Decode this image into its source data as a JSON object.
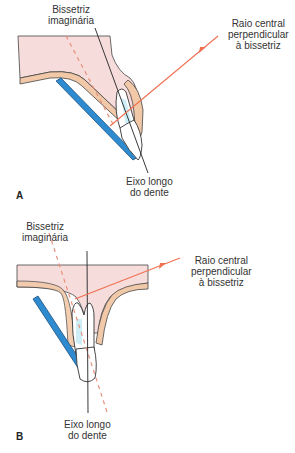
{
  "colors": {
    "gum": "#f7dcdc",
    "gum_edge": "#b07070",
    "mucosa": "#f2c9a8",
    "film": "#2e8bd0",
    "film_edge": "#1a4f80",
    "pulp": "#cdeef6",
    "central_ray": "#f07050",
    "bisector": "#e8907a",
    "axis": "#222222"
  },
  "panels": [
    {
      "letter": "A",
      "labels": {
        "bisector_line1": "Bissetriz",
        "bisector_line2": "imaginária",
        "ray_line1": "Raio central",
        "ray_line2": "perpendicular",
        "ray_line3": "à bissetriz",
        "axis_line1": "Eixo longo",
        "axis_line2": "do dente"
      }
    },
    {
      "letter": "B",
      "labels": {
        "bisector_line1": "Bissetriz",
        "bisector_line2": "imaginária",
        "ray_line1": "Raio central",
        "ray_line2": "perpendicular",
        "ray_line3": "à bissetriz",
        "axis_line1": "Eixo longo",
        "axis_line2": "do dente"
      }
    }
  ]
}
